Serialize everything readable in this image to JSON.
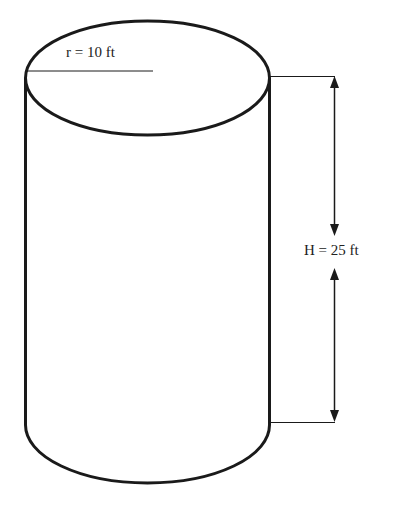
{
  "diagram": {
    "shape": "cylinder",
    "radius_label": "r = 10 ft",
    "height_label": "H = 25 ft",
    "colors": {
      "stroke": "#1a1a1a",
      "background": "#ffffff"
    }
  }
}
